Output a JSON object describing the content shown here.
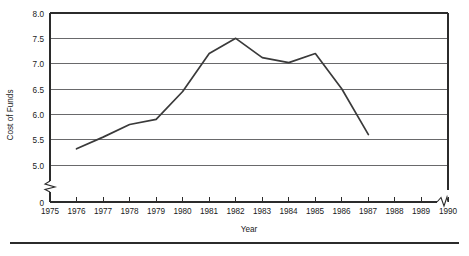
{
  "chart_data": {
    "type": "line",
    "title": "",
    "xlabel": "Year",
    "ylabel": "Cost of Funds",
    "x": [
      1976,
      1977,
      1978,
      1979,
      1980,
      1981,
      1982,
      1983,
      1984,
      1985,
      1986,
      1987
    ],
    "values": [
      5.32,
      5.55,
      5.8,
      5.9,
      6.45,
      7.2,
      7.5,
      7.12,
      7.02,
      7.2,
      6.5,
      5.6
    ],
    "series": [
      {
        "name": "Cost of Funds",
        "values": [
          5.32,
          5.55,
          5.8,
          5.9,
          6.45,
          7.2,
          7.5,
          7.12,
          7.02,
          7.2,
          6.5,
          5.6
        ]
      }
    ],
    "x_tick_labels": [
      "1975",
      "1976",
      "1977",
      "1978",
      "1979",
      "1980",
      "1981",
      "1982",
      "1983",
      "1984",
      "1985",
      "1986",
      "1987",
      "1988",
      "1989",
      "1990"
    ],
    "y_tick_labels": [
      "0",
      "5.0",
      "5.5",
      "6.0",
      "6.5",
      "7.0",
      "7.5",
      "8.0"
    ],
    "y_tick_values": [
      0,
      5.0,
      5.5,
      6.0,
      6.5,
      7.0,
      7.5,
      8.0
    ],
    "ylim": [
      5.0,
      8.0
    ],
    "xlim": [
      1975,
      1990
    ],
    "grid": true,
    "legend": "none",
    "y_axis_break": true,
    "x_axis_break": true,
    "line_color": "#3a3a3a",
    "grid_color": "#59595b",
    "axis_color": "#2b2b2b",
    "background": "#ffffff"
  }
}
